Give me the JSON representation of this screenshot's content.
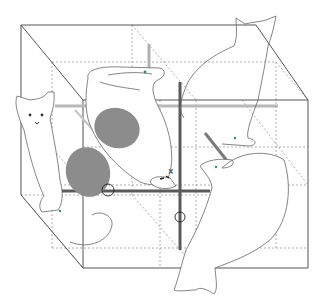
{
  "figure": {
    "colors": {
      "background": "#ffffff",
      "box_edge": "#555555",
      "dashed_edge": "#9a9a9a",
      "cat_outline": "#666666",
      "rod_dark": "#5a5a5a",
      "rod_light": "#b8b8b8",
      "spot": "#8c8c8c",
      "eye_dot": "#2e8b6e"
    },
    "icons": [
      "cat-sitting-left",
      "cat-sitting-top-right",
      "cat-sleeping-curled",
      "cat-reaching-right",
      "rotation-arrow"
    ]
  }
}
